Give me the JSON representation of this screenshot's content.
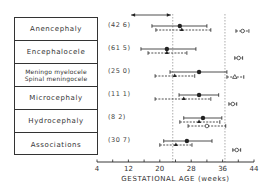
{
  "chart_data": {
    "type": "scatter",
    "subtype": "interval-plot",
    "title": "",
    "xlabel": "GESTATIONAL AGE (weeks)",
    "ylabel": "",
    "xlim": [
      4,
      44
    ],
    "xticks": [
      4,
      12,
      20,
      28,
      36,
      44
    ],
    "minor_tick_step": 4,
    "grid": false,
    "reference_lines": [
      23.3,
      36.6
    ],
    "top_arrow": {
      "from": 12.7,
      "to": 22.8,
      "type": "double-headed"
    },
    "categories": [
      "Anencephaly",
      "Encephalocele",
      "Meningo myelocele / Spinal meningocele",
      "Microcephaly",
      "Hydrocephaly",
      "Associations"
    ],
    "percent_labels": [
      "(42 6)",
      "(61 5)",
      "(25 0)",
      "(11 1)",
      "(8 2)",
      "(30 7)"
    ],
    "series": [
      {
        "name": "solid-circle",
        "marker": "filled-circle",
        "line": "solid",
        "points": [
          {
            "mean": 25.1,
            "low": 18.0,
            "high": 32.0
          },
          {
            "mean": 21.8,
            "low": 15.2,
            "high": 29.2
          },
          {
            "mean": 30.0,
            "low": 22.6,
            "high": 37.1
          },
          {
            "mean": 30.0,
            "low": 24.9,
            "high": 35.0
          },
          {
            "mean": 31.0,
            "low": 26.1,
            "high": 35.8
          },
          {
            "mean": 26.9,
            "low": 21.0,
            "high": 33.3
          }
        ]
      },
      {
        "name": "dashed-triangle",
        "marker": "filled-triangle",
        "line": "dashed",
        "points": [
          {
            "mean": 25.6,
            "low": 19.0,
            "high": 33.0
          },
          {
            "mean": 21.8,
            "low": 17.0,
            "high": 26.9
          },
          {
            "mean": 23.8,
            "low": 18.8,
            "high": 28.9
          },
          {
            "mean": 26.1,
            "low": 18.8,
            "high": 33.0
          },
          {
            "mean": 30.0,
            "low": 25.1,
            "high": 35.3
          },
          {
            "mean": 24.1,
            "low": 20.0,
            "high": 28.2
          }
        ]
      },
      {
        "name": "dashed-open",
        "marker": "open-circle",
        "line": "dashed",
        "points": [
          {
            "mean": 41.1,
            "low": 39.4,
            "high": 42.7
          },
          {
            "mean": 40.1,
            "low": 39.1,
            "high": 41.1
          },
          {
            "mean": 39.1,
            "low": 37.1,
            "high": 41.4
          },
          {
            "mean": 38.6,
            "low": 37.6,
            "high": 39.6
          },
          {
            "mean": 32.0,
            "low": 27.2,
            "high": 36.8
          },
          {
            "mean": 39.6,
            "low": 38.6,
            "high": 40.6
          }
        ]
      }
    ]
  },
  "labels": {
    "rows": [
      {
        "text": "Anencephaly"
      },
      {
        "text": "Encephalocele"
      },
      {
        "text": "Meningo myelocele",
        "text2": "Spinal meningocele"
      },
      {
        "text": "Microcephaly"
      },
      {
        "text": "Hydrocephaly"
      },
      {
        "text": "Associations"
      }
    ],
    "percents": [
      "(42 6)",
      "(61 5)",
      "(25 0)",
      "(11 1)",
      "(8 2)",
      "(30 7)"
    ]
  },
  "axis": {
    "title": "GESTATIONAL AGE (weeks)",
    "ticks": [
      "4",
      "12",
      "20",
      "28",
      "36",
      "44"
    ]
  }
}
